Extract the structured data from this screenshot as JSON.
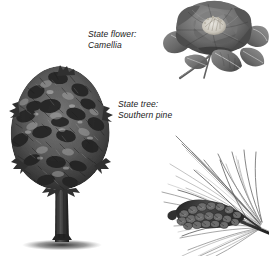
{
  "page": {
    "background_color": "#ffffff",
    "width": 269,
    "height": 256,
    "ink_color": "#2b2b2b",
    "text_color": "#1a1a1a"
  },
  "flower_label": {
    "line1": "State flower:",
    "line2": "Camellia"
  },
  "tree_label": {
    "line1": "State tree:",
    "line2": "Southern pine"
  },
  "illustrations": {
    "camellia": {
      "name": "camellia-illustration",
      "description": "grayscale botanical engraving of a camellia bloom with leaves and stem"
    },
    "pine_tree": {
      "name": "pine-tree-illustration",
      "description": "grayscale engraving of a southern pine tree with conical crown, straight trunk and ground shadow"
    },
    "pine_branch": {
      "name": "pine-branch-illustration",
      "description": "grayscale engraving of a southern pine branch with long needles and a pine cone"
    }
  }
}
